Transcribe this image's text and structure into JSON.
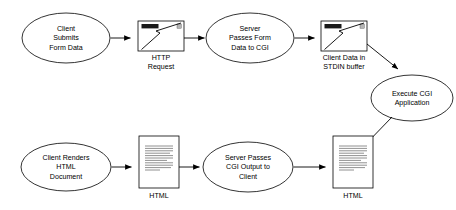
{
  "diagram": {
    "type": "flowchart",
    "background_color": "#ffffff",
    "stroke_color": "#000000",
    "nodes": [
      {
        "id": "client-submits",
        "shape": "ellipse",
        "lines": [
          "Client",
          "Submits",
          "Form Data"
        ],
        "row": "top"
      },
      {
        "id": "http-request",
        "shape": "window-icon",
        "icon": "browser-window-lightning-icon",
        "lines": [
          "HTTP",
          "Request"
        ],
        "row": "top"
      },
      {
        "id": "server-passes-form",
        "shape": "ellipse",
        "lines": [
          "Server",
          "Passes Form",
          "Data to CGI"
        ],
        "row": "top"
      },
      {
        "id": "client-data-stdin",
        "shape": "window-icon",
        "icon": "browser-window-lightning-icon",
        "lines": [
          "Client Data in",
          "STDIN buffer"
        ],
        "row": "top"
      },
      {
        "id": "execute-cgi",
        "shape": "ellipse",
        "lines": [
          "Execute CGI",
          "Application"
        ],
        "row": "middle"
      },
      {
        "id": "client-renders",
        "shape": "ellipse",
        "lines": [
          "Client Renders",
          "HTML",
          "Document"
        ],
        "row": "bottom"
      },
      {
        "id": "html-doc-left",
        "shape": "document-icon",
        "icon": "html-document-icon",
        "lines": [
          "HTML"
        ],
        "row": "bottom"
      },
      {
        "id": "server-passes-output",
        "shape": "ellipse",
        "lines": [
          "Server Passes",
          "CGI Output to",
          "Client"
        ],
        "row": "bottom"
      },
      {
        "id": "html-doc-right",
        "shape": "document-icon",
        "icon": "html-document-icon",
        "lines": [
          "HTML"
        ],
        "row": "bottom"
      }
    ],
    "edges": [
      {
        "from": "client-submits",
        "to": "http-request",
        "style": "arrow"
      },
      {
        "from": "http-request",
        "to": "server-passes-form",
        "style": "arrow"
      },
      {
        "from": "server-passes-form",
        "to": "client-data-stdin",
        "style": "arrow"
      },
      {
        "from": "client-data-stdin",
        "to": "execute-cgi",
        "style": "arrow-diagonal"
      },
      {
        "from": "execute-cgi",
        "to": "html-doc-right",
        "style": "arrow-diagonal"
      },
      {
        "from": "html-doc-right",
        "to": "server-passes-output",
        "style": "arrow-reverse"
      },
      {
        "from": "server-passes-output",
        "to": "html-doc-left",
        "style": "arrow-reverse"
      },
      {
        "from": "html-doc-left",
        "to": "client-renders",
        "style": "arrow-reverse"
      }
    ]
  },
  "labels": {
    "n0_l0": "Client",
    "n0_l1": "Submits",
    "n0_l2": "Form Data",
    "n1_l0": "HTTP",
    "n1_l1": "Request",
    "n2_l0": "Server",
    "n2_l1": "Passes Form",
    "n2_l2": "Data to CGI",
    "n3_l0": "Client Data in",
    "n3_l1": "STDIN buffer",
    "n4_l0": "Execute CGI",
    "n4_l1": "Application",
    "n5_l0": "Client Renders",
    "n5_l1": "HTML",
    "n5_l2": "Document",
    "n6_l0": "HTML",
    "n7_l0": "Server Passes",
    "n7_l1": "CGI Output to",
    "n7_l2": "Client",
    "n8_l0": "HTML"
  }
}
